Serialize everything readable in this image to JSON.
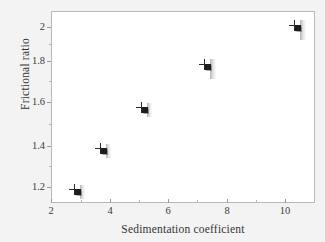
{
  "chart_data": {
    "type": "scatter",
    "title": "",
    "xlabel": "Sedimentation coefficient",
    "ylabel": "Frictional ratio",
    "xlim": [
      2,
      11
    ],
    "ylim": [
      1.12,
      2.06
    ],
    "grid": false,
    "legend": null,
    "xticks": [
      "2",
      "4",
      "6",
      "8",
      "10"
    ],
    "xtick_values": [
      2,
      4,
      6,
      8,
      10
    ],
    "yticks": [
      "1.2",
      "1.4",
      "1.6",
      "1.8",
      "2"
    ],
    "ytick_values": [
      1.2,
      1.4,
      1.6,
      1.8,
      2.0
    ],
    "x": [
      2.8,
      3.7,
      5.1,
      7.25,
      10.3
    ],
    "y": [
      1.19,
      1.39,
      1.59,
      1.8,
      1.99
    ],
    "points": [
      {
        "x": 2.8,
        "y": 1.19,
        "marker": "square-plus"
      },
      {
        "x": 3.7,
        "y": 1.39,
        "marker": "square-plus"
      },
      {
        "x": 5.1,
        "y": 1.59,
        "marker": "square-plus"
      },
      {
        "x": 7.25,
        "y": 1.8,
        "marker": "square-plus"
      },
      {
        "x": 10.3,
        "y": 1.99,
        "marker": "square-plus"
      }
    ]
  },
  "axes": {
    "y_title": "Frictional ratio",
    "x_title": "Sedimentation coefficient",
    "y_tick_labels": [
      "2",
      "1.8",
      "1.6",
      "1.4",
      "1.2"
    ],
    "x_tick_labels": [
      "2",
      "4",
      "6",
      "8",
      "10"
    ]
  },
  "colors": {
    "page_background": "#f3f3f3",
    "plot_background": "#ffffff",
    "frame": "#b9b9b9",
    "marker": "#1d1d1d",
    "tick": "#9a9a9a",
    "text": "#333333"
  }
}
